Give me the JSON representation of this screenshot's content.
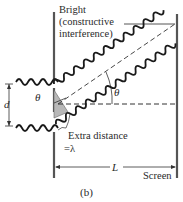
{
  "figure": {
    "subfigure_label": "(b)",
    "title_lines": [
      "Bright",
      "(constructive",
      "interference)"
    ],
    "labels": {
      "slit_separation": "d",
      "angle_at_slit": "θ",
      "angle_at_center": "θ",
      "extra_distance_line1": "Extra distance",
      "extra_distance_line2": "=λ",
      "distance_to_screen": "L",
      "screen": "Screen"
    },
    "colors": {
      "ink": "#2a2a2a",
      "barrier": "#555555",
      "wedge_fill": "#b8b8b8",
      "background": "#ffffff"
    }
  }
}
